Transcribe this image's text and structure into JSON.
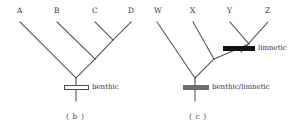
{
  "figure": {
    "type": "cladogram-pair",
    "background_color": "#ffffff",
    "line_color": "#555555"
  },
  "panels": [
    {
      "id": "b",
      "caption": "( b )",
      "tips": [
        {
          "label": "A",
          "x": 20,
          "y": 22
        },
        {
          "label": "B",
          "x": 57,
          "y": 22
        },
        {
          "label": "C",
          "x": 95,
          "y": 22
        },
        {
          "label": "D",
          "x": 131,
          "y": 22
        }
      ],
      "topology": "(A,(B,(C,D)))",
      "nodes": [
        {
          "name": "root",
          "x": 76,
          "y": 78
        },
        {
          "name": "clade-bcd",
          "x": 95,
          "y": 59
        },
        {
          "name": "clade-cd",
          "x": 113,
          "y": 40
        }
      ],
      "root_stem": {
        "x": 76,
        "y_top": 78,
        "y_bottom": 101
      },
      "state_bars": [
        {
          "name": "benthic-bar",
          "label": "benthic",
          "style": "hollow",
          "fill_color": "#ffffff",
          "border_color": "#4a4a4a",
          "x": 64,
          "y": 85,
          "width": 25,
          "height": 5,
          "label_x": 92,
          "label_y": 84
        }
      ]
    },
    {
      "id": "c",
      "caption": "( c )",
      "tips": [
        {
          "label": "W",
          "x": 10,
          "y": 22
        },
        {
          "label": "X",
          "x": 46,
          "y": 22
        },
        {
          "label": "Y",
          "x": 83,
          "y": 22
        },
        {
          "label": "Z",
          "x": 121,
          "y": 22
        }
      ],
      "topology": "(W,(X,(Y,Z)))",
      "nodes": [
        {
          "name": "root",
          "x": 48,
          "y": 78
        },
        {
          "name": "clade-xyz",
          "x": 67,
          "y": 59
        },
        {
          "name": "clade-yz",
          "x": 102,
          "y": 44
        }
      ],
      "root_stem": {
        "x": 48,
        "y_top": 78,
        "y_bottom": 101
      },
      "state_bars": [
        {
          "name": "limnetic-bar",
          "label": "limnetic",
          "style": "solid",
          "fill_color": "#111111",
          "border_color": "#111111",
          "x": 76,
          "y": 46,
          "width": 32,
          "height": 5,
          "label_x": 111,
          "label_y": 45
        },
        {
          "name": "benthic-limnetic-bar",
          "label": "benthic/limnetic",
          "style": "grey",
          "fill_color": "#6e6e6e",
          "border_color": "#6e6e6e",
          "x": 36,
          "y": 85,
          "width": 26,
          "height": 5,
          "label_x": 65,
          "label_y": 84
        }
      ]
    }
  ]
}
